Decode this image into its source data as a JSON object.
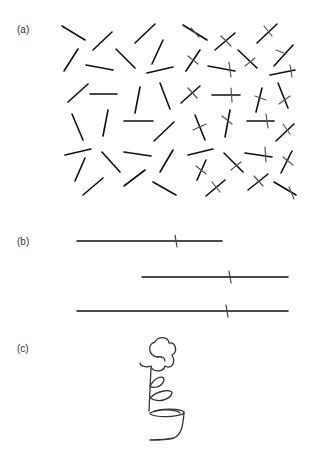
{
  "panels": {
    "a": {
      "label": "(a)"
    },
    "b": {
      "label": "(b)"
    },
    "c": {
      "label": "(c)"
    }
  },
  "panel_a_plain": [
    [
      62,
      26,
      85,
      40
    ],
    [
      93,
      50,
      112,
      32
    ],
    [
      135,
      43,
      155,
      24
    ],
    [
      64,
      71,
      78,
      49
    ],
    [
      86,
      65,
      113,
      70
    ],
    [
      116,
      49,
      135,
      68
    ],
    [
      152,
      64,
      163,
      40
    ],
    [
      147,
      73,
      173,
      67
    ],
    [
      68,
      102,
      88,
      84
    ],
    [
      90,
      94,
      117,
      94
    ],
    [
      135,
      113,
      140,
      87
    ],
    [
      160,
      83,
      170,
      109
    ],
    [
      72,
      114,
      83,
      140
    ],
    [
      103,
      136,
      108,
      110
    ],
    [
      124,
      121,
      153,
      121
    ],
    [
      154,
      141,
      174,
      122
    ],
    [
      65,
      155,
      91,
      149
    ],
    [
      102,
      152,
      120,
      172
    ],
    [
      124,
      152,
      151,
      156
    ],
    [
      160,
      172,
      173,
      150
    ],
    [
      75,
      181,
      85,
      158
    ],
    [
      83,
      195,
      103,
      178
    ],
    [
      124,
      186,
      145,
      170
    ],
    [
      153,
      182,
      176,
      195
    ],
    [
      188,
      155,
      213,
      149
    ]
  ],
  "panel_a_crossed": [
    [
      [
        183,
        25,
        207,
        40
      ],
      [
        191,
        28,
        199,
        37
      ]
    ],
    [
      [
        215,
        50,
        235,
        33
      ],
      [
        221,
        36,
        231,
        46
      ]
    ],
    [
      [
        257,
        43,
        277,
        24
      ],
      [
        264,
        26,
        272,
        36
      ]
    ],
    [
      [
        186,
        71,
        200,
        50
      ],
      [
        188,
        56,
        198,
        64
      ]
    ],
    [
      [
        208,
        66,
        235,
        71
      ],
      [
        229,
        62,
        231,
        77
      ]
    ],
    [
      [
        238,
        50,
        257,
        68
      ],
      [
        245,
        66,
        255,
        58
      ]
    ],
    [
      [
        274,
        66,
        293,
        45
      ],
      [
        276,
        50,
        286,
        54
      ]
    ],
    [
      [
        270,
        75,
        295,
        70
      ],
      [
        290,
        65,
        292,
        77
      ]
    ],
    [
      [
        181,
        103,
        200,
        86
      ],
      [
        188,
        88,
        197,
        98
      ]
    ],
    [
      [
        212,
        95,
        240,
        95
      ],
      [
        231,
        88,
        232,
        102
      ]
    ],
    [
      [
        256,
        112,
        262,
        88
      ],
      [
        255,
        96,
        266,
        100
      ]
    ],
    [
      [
        278,
        83,
        288,
        108
      ],
      [
        279,
        104,
        290,
        96
      ]
    ],
    [
      [
        195,
        115,
        205,
        140
      ],
      [
        193,
        130,
        206,
        124
      ]
    ],
    [
      [
        225,
        137,
        230,
        110
      ],
      [
        222,
        116,
        232,
        124
      ]
    ],
    [
      [
        247,
        121,
        274,
        121
      ],
      [
        266,
        114,
        268,
        128
      ]
    ],
    [
      [
        276,
        141,
        294,
        124
      ],
      [
        283,
        124,
        290,
        134
      ]
    ],
    [
      [
        224,
        153,
        243,
        172
      ],
      [
        231,
        170,
        241,
        162
      ]
    ],
    [
      [
        245,
        153,
        272,
        157
      ],
      [
        265,
        147,
        266,
        162
      ]
    ],
    [
      [
        281,
        173,
        292,
        151
      ],
      [
        283,
        157,
        293,
        165
      ]
    ],
    [
      [
        197,
        180,
        206,
        160
      ],
      [
        196,
        166,
        206,
        174
      ]
    ],
    [
      [
        206,
        196,
        225,
        180
      ],
      [
        212,
        182,
        220,
        192
      ]
    ],
    [
      [
        248,
        190,
        268,
        174
      ],
      [
        254,
        176,
        263,
        186
      ]
    ],
    [
      [
        274,
        182,
        296,
        195
      ],
      [
        289,
        187,
        294,
        199
      ]
    ]
  ],
  "panel_b_lines": [
    {
      "x1": 77,
      "x2": 222,
      "y": 241,
      "mark_x": 176
    },
    {
      "x1": 142,
      "x2": 288,
      "y": 277,
      "mark_x": 230
    },
    {
      "x1": 77,
      "x2": 288,
      "y": 311,
      "mark_x": 227
    }
  ]
}
